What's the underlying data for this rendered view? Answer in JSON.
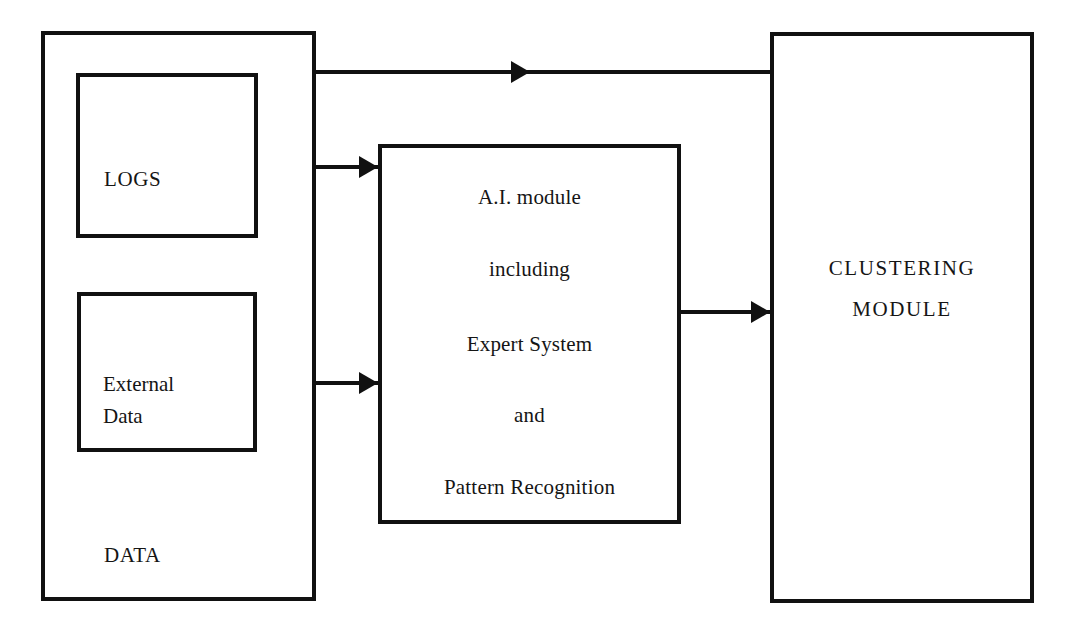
{
  "diagram": {
    "background_color": "#ffffff",
    "line_color": "#111111",
    "text_color": "#151515"
  },
  "boxes": {
    "data": {
      "label": "DATA",
      "x": 41,
      "y": 31,
      "w": 275,
      "h": 570
    },
    "logs": {
      "label": "LOGS",
      "x": 76,
      "y": 73,
      "w": 182,
      "h": 165
    },
    "external_data": {
      "line1": "External",
      "line2": "Data",
      "x": 77,
      "y": 292,
      "w": 180,
      "h": 160
    },
    "ai_module": {
      "x": 378,
      "y": 144,
      "w": 303,
      "h": 380,
      "lines": [
        "A.I. module",
        "including",
        "Expert System",
        "and",
        "Pattern Recognition"
      ]
    },
    "clustering_module": {
      "x": 770,
      "y": 32,
      "w": 264,
      "h": 571,
      "line1": "CLUSTERING",
      "line2": "MODULE"
    }
  },
  "arrows": [
    {
      "name": "data-to-clustering",
      "from": "DATA",
      "to": "CLUSTERING MODULE",
      "x": 315,
      "y": 72,
      "length": 455,
      "head_at": 511
    },
    {
      "name": "logs-to-ai-module",
      "from": "DATA",
      "to": "A.I. module",
      "x": 315,
      "y": 167,
      "length": 63,
      "head_at": 44
    },
    {
      "name": "external-data-to-ai-module",
      "from": "DATA",
      "to": "A.I. module",
      "x": 315,
      "y": 383,
      "length": 63,
      "head_at": 44
    },
    {
      "name": "ai-module-to-clustering",
      "from": "A.I. module",
      "to": "CLUSTERING MODULE",
      "x": 680,
      "y": 312,
      "length": 90,
      "head_at": 71
    }
  ]
}
